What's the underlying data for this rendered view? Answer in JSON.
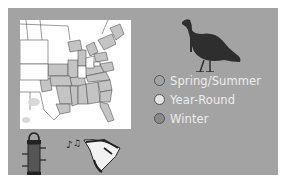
{
  "range_map": {
    "region": "Eastern United States",
    "legend": [
      {
        "label": "Spring/Summer",
        "color": "#a3a3a3"
      },
      {
        "label": "Year-Round",
        "color": "#e4e4e4"
      },
      {
        "label": "Winter",
        "color": "#8a8a8a"
      }
    ]
  },
  "icons": {
    "bird": "wild-turkey-silhouette",
    "feeder": "bird-feeder-icon",
    "song": "bird-song-icon"
  },
  "colors": {
    "panel": "#a3a3a3",
    "map_background": "#ffffff",
    "range_fill": "#c4c4c4",
    "border": "#555555"
  }
}
